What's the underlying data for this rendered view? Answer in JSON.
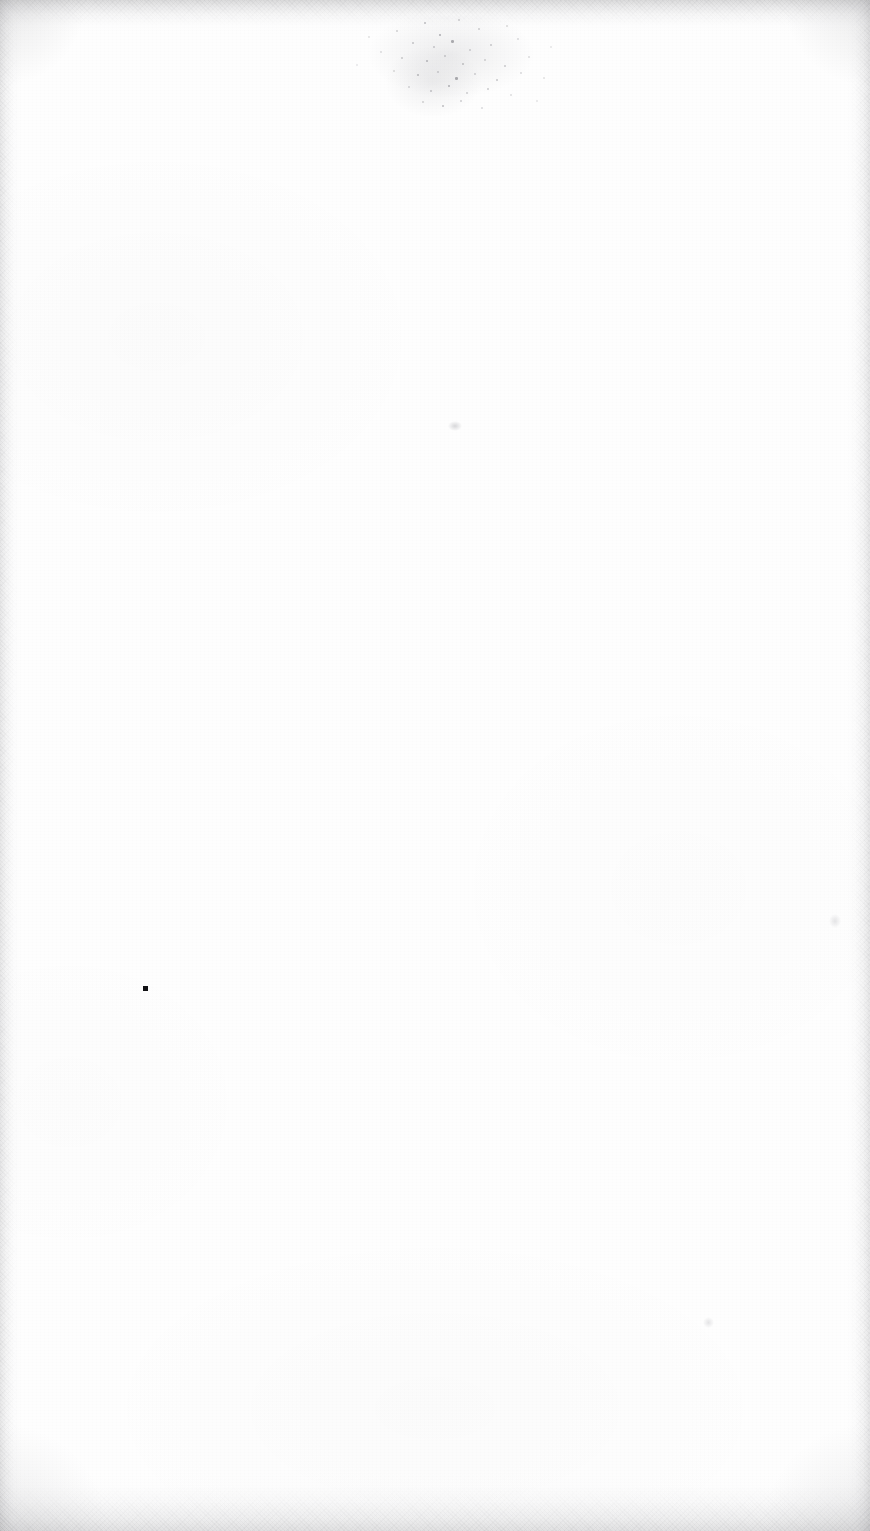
{
  "page": {
    "kind": "scanned-document-page",
    "content_text": "",
    "description": "Blank scanned page",
    "width_px": 870,
    "height_px": 1531,
    "orientation": "portrait",
    "paper_color": "#fefefe",
    "edge_shadow_color": "#a0a0a3",
    "ink_color": "#111114"
  },
  "marks": {
    "spatter_cluster": {
      "name": "ink-spatter-cluster",
      "x": 338,
      "y": 16,
      "width": 226,
      "height": 100,
      "color": "#8d8d93",
      "specks": [
        {
          "x": 86,
          "y": 6,
          "d": 2.0,
          "o": 0.55
        },
        {
          "x": 120,
          "y": 3,
          "d": 1.5,
          "o": 0.4
        },
        {
          "x": 58,
          "y": 14,
          "d": 1.5,
          "o": 0.35
        },
        {
          "x": 101,
          "y": 18,
          "d": 2.4,
          "o": 0.7
        },
        {
          "x": 140,
          "y": 12,
          "d": 1.5,
          "o": 0.38
        },
        {
          "x": 168,
          "y": 9,
          "d": 1.5,
          "o": 0.3
        },
        {
          "x": 74,
          "y": 26,
          "d": 2.0,
          "o": 0.48
        },
        {
          "x": 95,
          "y": 30,
          "d": 1.5,
          "o": 0.42
        },
        {
          "x": 113,
          "y": 24,
          "d": 2.6,
          "o": 0.72
        },
        {
          "x": 131,
          "y": 33,
          "d": 1.5,
          "o": 0.36
        },
        {
          "x": 152,
          "y": 28,
          "d": 2.0,
          "o": 0.46
        },
        {
          "x": 179,
          "y": 22,
          "d": 1.5,
          "o": 0.28
        },
        {
          "x": 42,
          "y": 35,
          "d": 1.5,
          "o": 0.26
        },
        {
          "x": 63,
          "y": 41,
          "d": 2.0,
          "o": 0.45
        },
        {
          "x": 88,
          "y": 44,
          "d": 2.4,
          "o": 0.62
        },
        {
          "x": 106,
          "y": 39,
          "d": 1.5,
          "o": 0.4
        },
        {
          "x": 124,
          "y": 47,
          "d": 2.0,
          "o": 0.52
        },
        {
          "x": 146,
          "y": 43,
          "d": 1.5,
          "o": 0.34
        },
        {
          "x": 166,
          "y": 49,
          "d": 2.0,
          "o": 0.44
        },
        {
          "x": 190,
          "y": 40,
          "d": 1.5,
          "o": 0.26
        },
        {
          "x": 55,
          "y": 54,
          "d": 1.5,
          "o": 0.3
        },
        {
          "x": 79,
          "y": 58,
          "d": 2.2,
          "o": 0.58
        },
        {
          "x": 99,
          "y": 55,
          "d": 1.5,
          "o": 0.38
        },
        {
          "x": 117,
          "y": 61,
          "d": 2.6,
          "o": 0.74
        },
        {
          "x": 136,
          "y": 57,
          "d": 1.5,
          "o": 0.36
        },
        {
          "x": 158,
          "y": 63,
          "d": 2.0,
          "o": 0.48
        },
        {
          "x": 182,
          "y": 56,
          "d": 1.5,
          "o": 0.28
        },
        {
          "x": 205,
          "y": 61,
          "d": 1.5,
          "o": 0.22
        },
        {
          "x": 70,
          "y": 70,
          "d": 1.5,
          "o": 0.32
        },
        {
          "x": 92,
          "y": 74,
          "d": 2.0,
          "o": 0.5
        },
        {
          "x": 110,
          "y": 69,
          "d": 2.4,
          "o": 0.66
        },
        {
          "x": 128,
          "y": 76,
          "d": 1.5,
          "o": 0.38
        },
        {
          "x": 149,
          "y": 72,
          "d": 2.0,
          "o": 0.44
        },
        {
          "x": 172,
          "y": 78,
          "d": 1.5,
          "o": 0.26
        },
        {
          "x": 84,
          "y": 85,
          "d": 1.5,
          "o": 0.34
        },
        {
          "x": 104,
          "y": 89,
          "d": 2.2,
          "o": 0.56
        },
        {
          "x": 122,
          "y": 84,
          "d": 1.5,
          "o": 0.36
        },
        {
          "x": 143,
          "y": 91,
          "d": 1.5,
          "o": 0.28
        },
        {
          "x": 30,
          "y": 20,
          "d": 1.5,
          "o": 0.22
        },
        {
          "x": 212,
          "y": 30,
          "d": 1.5,
          "o": 0.2
        },
        {
          "x": 18,
          "y": 48,
          "d": 1.5,
          "o": 0.18
        },
        {
          "x": 198,
          "y": 84,
          "d": 1.5,
          "o": 0.2
        }
      ]
    },
    "ink_speck": {
      "name": "ink-speck",
      "x": 143,
      "y": 986,
      "width": 5,
      "height": 5,
      "color": "#111114"
    },
    "smudges": [
      {
        "name": "faint-smudge-upper-centre",
        "x": 448,
        "y": 421,
        "width": 14,
        "height": 10,
        "color": "#b8b8bc",
        "opacity": 0.55
      },
      {
        "name": "faint-smudge-right",
        "x": 829,
        "y": 914,
        "width": 12,
        "height": 14,
        "color": "#c6c6ca",
        "opacity": 0.45
      },
      {
        "name": "faint-smudge-lower-right",
        "x": 703,
        "y": 1317,
        "width": 11,
        "height": 11,
        "color": "#c2c2c6",
        "opacity": 0.42
      }
    ]
  }
}
